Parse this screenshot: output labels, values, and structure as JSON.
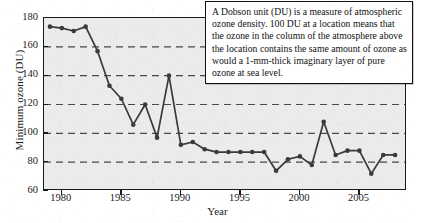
{
  "chart_data": {
    "type": "line",
    "title": "",
    "xlabel": "Year",
    "ylabel": "Minimum ozone (DU)",
    "xlim": [
      1978.5,
      2009.0
    ],
    "ylim": [
      60,
      180
    ],
    "xticks": [
      1980,
      1985,
      1990,
      1995,
      2000,
      2005
    ],
    "xticklabels": [
      "1980",
      "1985",
      "1990",
      "1995",
      "2000",
      "2005"
    ],
    "yticks": [
      60,
      80,
      100,
      120,
      140,
      160,
      180
    ],
    "yticklabels": [
      "60",
      "80",
      "100",
      "120",
      "140",
      "160",
      "180"
    ],
    "grid": "horizontal-dashed",
    "legend": "none",
    "marker": "filled-circle",
    "line_color": "#3a3a3a",
    "marker_color": "#3a3a3a",
    "plot_background": "#ebebeb",
    "series": [
      {
        "name": "Minimum ozone",
        "x": [
          1979,
          1980,
          1981,
          1982,
          1983,
          1984,
          1985,
          1986,
          1987,
          1988,
          1989,
          1990,
          1991,
          1992,
          1993,
          1994,
          1995,
          1996,
          1997,
          1998,
          1999,
          2000,
          2001,
          2002,
          2003,
          2004,
          2005,
          2006,
          2007,
          2008
        ],
        "y": [
          174,
          173,
          171,
          174,
          157,
          133,
          124,
          106,
          120,
          97,
          140,
          92,
          94,
          89,
          87,
          87,
          87,
          87,
          87,
          74,
          82,
          84,
          78,
          108,
          85,
          88,
          88,
          72,
          85,
          85
        ]
      }
    ]
  },
  "annotation": {
    "text": "A Dobson unit (DU) is a measure of atmospheric ozone density. 100 DU at a location means that the ozone in the column of the atmosphere above the location contains the same amount of ozone as would a 1-mm-thick imaginary layer of pure ozone at sea level."
  }
}
